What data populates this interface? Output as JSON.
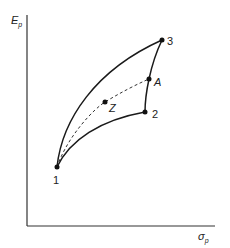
{
  "diagram": {
    "type": "efficient-frontier-portfolio-diagram",
    "axes": {
      "y_label": "E",
      "y_label_subscript": "p",
      "x_label": "σ",
      "x_label_subscript": "p"
    },
    "points": [
      {
        "id": "1",
        "label": "1",
        "x": 57,
        "y": 167
      },
      {
        "id": "2",
        "label": "2",
        "x": 145,
        "y": 112
      },
      {
        "id": "3",
        "label": "3",
        "x": 162,
        "y": 40
      },
      {
        "id": "A",
        "label": "A",
        "x": 149,
        "y": 79
      },
      {
        "id": "Z",
        "label": "Z",
        "x": 105,
        "y": 102
      }
    ],
    "curves": [
      {
        "name": "curve-1-3",
        "from": "1",
        "to": "3",
        "style": "solid"
      },
      {
        "name": "curve-1-2",
        "from": "1",
        "to": "2",
        "style": "solid"
      },
      {
        "name": "curve-2-3",
        "from": "2",
        "to": "3",
        "style": "solid"
      },
      {
        "name": "curve-1-A",
        "from": "1",
        "to": "A",
        "style": "dashed",
        "through": "Z"
      }
    ],
    "colors": {
      "line": "#1a1a1a",
      "axis": "#333333",
      "background": "#ffffff"
    }
  }
}
